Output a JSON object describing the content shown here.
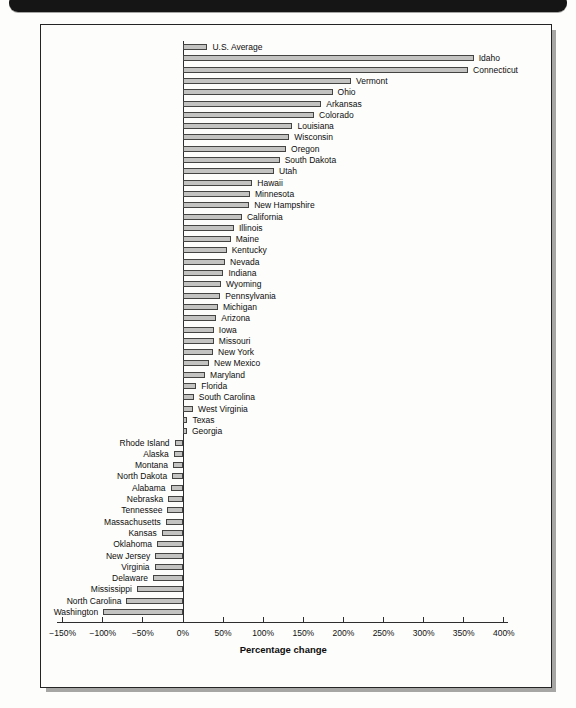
{
  "colors": {
    "bar_fill": "#c3c3c1",
    "bar_border": "#444442",
    "axis": "#2e2e2e",
    "header_bar": "#151515",
    "figure_shadow": "#a6a6a4"
  },
  "chart_data": {
    "type": "bar",
    "orientation": "horizontal",
    "title": "",
    "xlabel": "Percentage change",
    "ylabel": "",
    "xlim": [
      -150,
      400
    ],
    "grid": false,
    "legend": false,
    "x_tick_values": [
      -150,
      -100,
      -50,
      0,
      50,
      100,
      150,
      200,
      250,
      300,
      350,
      400
    ],
    "x_tick_labels": [
      "−150%",
      "−100%",
      "−50%",
      "0%",
      "50%",
      "100%",
      "150%",
      "200%",
      "250%",
      "300%",
      "350%",
      "400%"
    ],
    "categories": [
      "U.S. Average",
      "Idaho",
      "Connecticut",
      "Vermont",
      "Ohio",
      "Arkansas",
      "Colorado",
      "Louisiana",
      "Wisconsin",
      "Oregon",
      "South Dakota",
      "Utah",
      "Hawaii",
      "Minnesota",
      "New Hampshire",
      "California",
      "Illinois",
      "Maine",
      "Kentucky",
      "Nevada",
      "Indiana",
      "Wyoming",
      "Pennsylvania",
      "Michigan",
      "Arizona",
      "Iowa",
      "Missouri",
      "New York",
      "New Mexico",
      "Maryland",
      "Florida",
      "South Carolina",
      "West Virginia",
      "Texas",
      "Georgia",
      "Rhode Island",
      "Alaska",
      "Montana",
      "North Dakota",
      "Alabama",
      "Nebraska",
      "Tennessee",
      "Massachusetts",
      "Kansas",
      "Oklahoma",
      "New Jersey",
      "Virginia",
      "Delaware",
      "Mississippi",
      "North Carolina",
      "Washington"
    ],
    "values": [
      28,
      360,
      353,
      207,
      184,
      170,
      161,
      134,
      130,
      126,
      118,
      111,
      84,
      81,
      80,
      71,
      61,
      57,
      52,
      50,
      48,
      45,
      44,
      41,
      39,
      36,
      36,
      35,
      30,
      25,
      14,
      11,
      10,
      3,
      2,
      -8,
      -9,
      -10,
      -11,
      -13,
      -16,
      -17,
      -19,
      -24,
      -30,
      -32,
      -33,
      -35,
      -55,
      -68,
      -97
    ]
  }
}
